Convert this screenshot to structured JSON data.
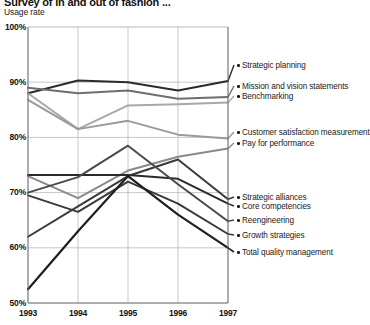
{
  "header": {
    "title": "Survey of in and out of fashion ...",
    "axis_caption": "Usage rate"
  },
  "chart_data": {
    "type": "line",
    "title": "Survey of in and out of fashion ...",
    "xlabel": "",
    "ylabel": "Usage rate",
    "categories": [
      "1993",
      "1994",
      "1995",
      "1996",
      "1997"
    ],
    "x": [
      1993,
      1994,
      1995,
      1996,
      1997
    ],
    "ylim": [
      50,
      100
    ],
    "yticks": [
      "50%",
      "60%",
      "70%",
      "80%",
      "90%",
      "100%"
    ],
    "ytick_values": [
      50,
      60,
      70,
      80,
      90,
      100
    ],
    "grid": true,
    "legend_position": "right",
    "series": [
      {
        "name": "Strategic planning",
        "color": "#2b2b2b",
        "width": 2.0,
        "values": [
          88.0,
          90.3,
          90.0,
          88.5,
          90.2
        ]
      },
      {
        "name": "Mission and vision statements",
        "color": "#6e6e6e",
        "width": 2.0,
        "values": [
          89.0,
          88.0,
          88.5,
          87.0,
          87.3
        ]
      },
      {
        "name": "Benchmarking",
        "color": "#a8a8a8",
        "width": 2.0,
        "values": [
          88.0,
          81.5,
          85.8,
          86.0,
          86.3
        ]
      },
      {
        "name": "Customer satisfaction measurement",
        "color": "#9a9a9a",
        "width": 2.0,
        "values": [
          86.8,
          81.5,
          83.0,
          80.5,
          79.8
        ]
      },
      {
        "name": "Pay for performance",
        "color": "#8a8a8a",
        "width": 2.0,
        "values": [
          73.0,
          69.0,
          74.0,
          76.5,
          78.0
        ]
      },
      {
        "name": "Strategic alliances",
        "color": "#3a3a3a",
        "width": 2.0,
        "values": [
          62.0,
          67.5,
          73.0,
          76.0,
          68.8
        ]
      },
      {
        "name": "Core competencies",
        "color": "#2b2b2b",
        "width": 2.0,
        "values": [
          73.2,
          73.2,
          73.2,
          72.5,
          68.0
        ]
      },
      {
        "name": "Reengineering",
        "color": "#4a4a4a",
        "width": 2.0,
        "values": [
          70.0,
          72.8,
          78.5,
          71.5,
          64.8
        ]
      },
      {
        "name": "Growth strategies",
        "color": "#3a3a3a",
        "width": 2.0,
        "values": [
          69.5,
          66.5,
          72.0,
          68.0,
          62.5
        ]
      },
      {
        "name": "Total quality management",
        "color": "#1f1f1f",
        "width": 2.2,
        "values": [
          52.5,
          63.0,
          73.0,
          66.0,
          60.0
        ]
      }
    ]
  },
  "legend": {
    "items": [
      {
        "label": "Strategic planning",
        "y": 68
      },
      {
        "label": "Mission and vision statements",
        "y": 89
      },
      {
        "label": "Benchmarking",
        "y": 99
      },
      {
        "label": "Customer satisfaction measurement",
        "y": 135
      },
      {
        "label": "Pay for performance",
        "y": 146
      },
      {
        "label": "Strategic alliances",
        "y": 200
      },
      {
        "label": "Core competencies",
        "y": 209
      },
      {
        "label": "Reengineering",
        "y": 223
      },
      {
        "label": "Growth strategies",
        "y": 238
      },
      {
        "label": "Total quality management",
        "y": 255
      }
    ]
  },
  "colors": {
    "grid": "#b9b9b9",
    "axis": "#6b6b6b",
    "text": "#1a1a1a"
  }
}
